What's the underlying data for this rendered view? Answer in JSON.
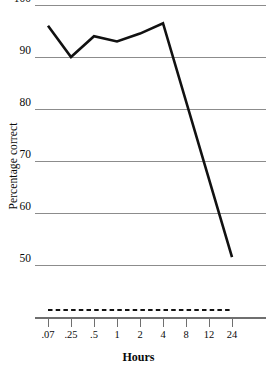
{
  "chart_data": {
    "type": "line",
    "title": "",
    "xlabel": "Hours",
    "ylabel": "Percentage correct",
    "categories": [
      ".07",
      ".25",
      ".5",
      "1",
      "2",
      "4",
      "8",
      "12",
      "24"
    ],
    "x_tick_labels": [
      ".07",
      ".25",
      ".5",
      "1",
      "2",
      "4",
      "8",
      "12",
      "24"
    ],
    "y_tick_labels": [
      "100",
      "90",
      "80",
      "70",
      "60",
      "50"
    ],
    "y_tick_values": [
      100,
      90,
      80,
      70,
      60,
      50
    ],
    "ylim": [
      45,
      100
    ],
    "xlim_index": [
      0,
      8
    ],
    "grid": true,
    "legend": "none",
    "series": [
      {
        "name": "Percentage correct",
        "values": [
          96.0,
          90.0,
          94.0,
          93.0,
          94.5,
          96.5,
          null,
          null,
          51.5
        ],
        "defined_points": [
          {
            "x_label": ".07",
            "x_index": 0,
            "y": 96.0
          },
          {
            "x_label": ".25",
            "x_index": 1,
            "y": 90.0
          },
          {
            "x_label": ".5",
            "x_index": 2,
            "y": 94.0
          },
          {
            "x_label": "1",
            "x_index": 3,
            "y": 93.0
          },
          {
            "x_label": "2",
            "x_index": 4,
            "y": 94.5
          },
          {
            "x_label": "4",
            "x_index": 5,
            "y": 96.5
          },
          {
            "x_label": "24",
            "x_index": 8,
            "y": 51.5
          }
        ],
        "color": "#111111",
        "line_width": 2.6
      }
    ],
    "annotations": [
      {
        "name": "baseline-dashed-marker",
        "style": "dashed",
        "color": "#111111",
        "from_x_index": 0,
        "to_x_index": 8,
        "description": "dashed horizontal reference line above the x-axis"
      }
    ],
    "colors": {
      "line": "#111111",
      "gridline": "#8c8c8c",
      "axis": "#6f6f6f",
      "text": "#0a0a0a",
      "background": "#ffffff"
    }
  }
}
